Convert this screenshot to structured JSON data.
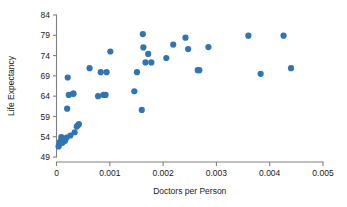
{
  "chart_data": {
    "type": "scatter",
    "title": "",
    "xlabel": "Doctors per Person",
    "ylabel": "Life Expectancy",
    "xlim": [
      0,
      0.005
    ],
    "ylim": [
      49,
      84
    ],
    "xticks": [
      0,
      0.001,
      0.002,
      0.003,
      0.004,
      0.005
    ],
    "xtick_labels": [
      "0",
      "0.001",
      "0.002",
      "0.003",
      "0.004",
      "0.005"
    ],
    "yticks": [
      49,
      54,
      59,
      64,
      69,
      74,
      79,
      84
    ],
    "ytick_labels": [
      "49",
      "54",
      "59",
      "64",
      "69",
      "74",
      "79",
      "84"
    ],
    "grid": false,
    "legend": false,
    "marker_color": "#2f75b5",
    "marker_size": 3.1,
    "axis_color": "#808080",
    "points": [
      [
        4e-05,
        51.6
      ],
      [
        6e-05,
        52.6
      ],
      [
        8e-05,
        53.0
      ],
      [
        9e-05,
        53.9
      ],
      [
        0.00011,
        52.5
      ],
      [
        0.00013,
        52.8
      ],
      [
        0.00016,
        53.0
      ],
      [
        0.00019,
        53.8
      ],
      [
        0.0002,
        60.9
      ],
      [
        0.00021,
        68.6
      ],
      [
        0.00023,
        64.3
      ],
      [
        0.00026,
        54.3
      ],
      [
        0.00031,
        64.6
      ],
      [
        0.00032,
        64.6
      ],
      [
        0.00034,
        55.1
      ],
      [
        0.00038,
        56.5
      ],
      [
        0.0004,
        56.8
      ],
      [
        0.00042,
        57.1
      ],
      [
        0.00062,
        70.9
      ],
      [
        0.00078,
        64.0
      ],
      [
        0.00083,
        69.9
      ],
      [
        0.00088,
        64.3
      ],
      [
        0.00092,
        64.3
      ],
      [
        0.00094,
        69.9
      ],
      [
        0.00101,
        75.0
      ],
      [
        0.00146,
        65.2
      ],
      [
        0.00151,
        69.9
      ],
      [
        0.0016,
        60.6
      ],
      [
        0.00162,
        79.3
      ],
      [
        0.00163,
        76.0
      ],
      [
        0.00167,
        72.3
      ],
      [
        0.00172,
        74.4
      ],
      [
        0.00178,
        72.3
      ],
      [
        0.00206,
        73.4
      ],
      [
        0.00219,
        76.7
      ],
      [
        0.00242,
        78.4
      ],
      [
        0.00247,
        75.6
      ],
      [
        0.00265,
        70.4
      ],
      [
        0.00268,
        70.4
      ],
      [
        0.00285,
        76.1
      ],
      [
        0.0036,
        78.9
      ],
      [
        0.00383,
        69.5
      ],
      [
        0.00426,
        78.9
      ],
      [
        0.0044,
        70.9
      ]
    ]
  }
}
